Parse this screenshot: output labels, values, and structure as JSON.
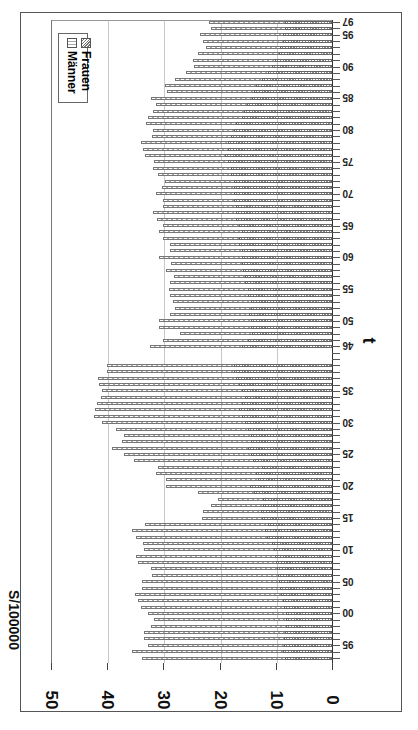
{
  "chart_data": {
    "type": "bar",
    "orientation": "rotated-90-clockwise",
    "title": "",
    "ylabel": "S/100000",
    "xlabel": "t",
    "ylim": [
      0,
      50
    ],
    "yticks": [
      0,
      10,
      20,
      30,
      40,
      50
    ],
    "grid": true,
    "legend_position": "upper-left (rotated)",
    "categories": [
      "1893",
      "1894",
      "1895",
      "1896",
      "1897",
      "1898",
      "1899",
      "1900",
      "1901",
      "1902",
      "1903",
      "1904",
      "1905",
      "1906",
      "1907",
      "1908",
      "1909",
      "1910",
      "1911",
      "1912",
      "1913",
      "1914",
      "1915",
      "1916",
      "1917",
      "1918",
      "1919",
      "1920",
      "1921",
      "1922",
      "1923",
      "1924",
      "1925",
      "1926",
      "1927",
      "1928",
      "1929",
      "1930",
      "1931",
      "1932",
      "1933",
      "1934",
      "1935",
      "1936",
      "1937",
      "1938",
      "1939",
      "",
      "",
      "1946",
      "1947",
      "1948",
      "1949",
      "1950",
      "1951",
      "1952",
      "1953",
      "1954",
      "1955",
      "1956",
      "1957",
      "1958",
      "1959",
      "1960",
      "1961",
      "1962",
      "1963",
      "1964",
      "1965",
      "1966",
      "1967",
      "1968",
      "1969",
      "1970",
      "1971",
      "1972",
      "1973",
      "1974",
      "1975",
      "1976",
      "1977",
      "1978",
      "1979",
      "1980",
      "1981",
      "1982",
      "1983",
      "1984",
      "1985",
      "1986",
      "1987",
      "1988",
      "1989",
      "1990",
      "1991",
      "1992",
      "1993",
      "1994",
      "1995",
      "1996",
      "1997"
    ],
    "category_tick_labels": [
      "95",
      "00",
      "05",
      "10",
      "15",
      "20",
      "25",
      "30",
      "35",
      "46",
      "50",
      "55",
      "60",
      "65",
      "70",
      "75",
      "80",
      "85",
      "90",
      "95",
      "97"
    ],
    "series": [
      {
        "name": "Männer",
        "pattern": "dashed-light",
        "values": [
          33.8,
          35.5,
          32.7,
          33.4,
          33.4,
          32.2,
          31.6,
          32.8,
          34.0,
          34.6,
          35.0,
          33.8,
          33.8,
          32.0,
          32.2,
          34.6,
          34.9,
          33.4,
          33.7,
          34.9,
          35.5,
          33.2,
          23.1,
          22.9,
          21.5,
          20.2,
          23.9,
          29.6,
          29.5,
          31.3,
          31.0,
          35.2,
          37.0,
          39.2,
          37.4,
          37.0,
          38.5,
          40.9,
          42.3,
          42.1,
          41.9,
          41.1,
          40.9,
          41.4,
          41.7,
          40.0,
          40.0,
          null,
          null,
          32.4,
          30.1,
          27.1,
          30.7,
          30.7,
          28.9,
          27.9,
          28.3,
          28.9,
          29.0,
          28.9,
          28.1,
          29.6,
          28.6,
          30.8,
          28.9,
          28.9,
          30.1,
          30.7,
          30.0,
          31.2,
          31.9,
          30.0,
          30.0,
          31.3,
          30.3,
          29.7,
          30.9,
          31.9,
          31.7,
          33.3,
          33.6,
          34.0,
          32.1,
          31.9,
          33.1,
          32.8,
          31.9,
          31.4,
          32.2,
          29.3,
          29.7,
          27.9,
          26.0,
          24.5,
          24.8,
          23.8,
          22.5,
          22.9,
          23.4,
          21.6,
          21.9
        ]
      },
      {
        "name": "Frauen",
        "pattern": "hatched-dark",
        "values": [
          8.4,
          8.7,
          8.5,
          8.5,
          8.3,
          8.2,
          8.1,
          8.2,
          8.5,
          8.7,
          9.0,
          9.2,
          9.5,
          9.6,
          9.8,
          10.0,
          10.2,
          10.4,
          10.6,
          11.5,
          11.9,
          11.4,
          12.5,
          12.6,
          12.2,
          12.2,
          13.8,
          14.6,
          13.2,
          13.5,
          12.5,
          14.0,
          14.5,
          15.0,
          14.5,
          14.5,
          15.0,
          15.5,
          16.0,
          16.5,
          16.0,
          15.5,
          16.0,
          16.5,
          17.0,
          17.5,
          17.5,
          null,
          null,
          16.1,
          15.0,
          14.3,
          14.5,
          14.5,
          14.8,
          14.5,
          14.5,
          15.0,
          15.0,
          15.5,
          15.5,
          15.8,
          16.0,
          16.0,
          16.0,
          16.5,
          16.5,
          16.0,
          16.5,
          17.0,
          17.0,
          17.0,
          17.5,
          17.5,
          17.5,
          17.5,
          18.0,
          18.0,
          18.5,
          19.0,
          18.5,
          18.5,
          18.0,
          17.5,
          17.0,
          16.0,
          15.7,
          15.1,
          14.3,
          13.9,
          13.5,
          12.4,
          11.4,
          10.7,
          10.1,
          9.5,
          9.2,
          8.8,
          8.8,
          8.4,
          8.3
        ]
      }
    ]
  },
  "legend": {
    "items": [
      {
        "label": "Männer"
      },
      {
        "label": "Frauen"
      }
    ]
  },
  "axis": {
    "value_title": "S/100000",
    "category_title": "t",
    "value_tick_labels": [
      "0",
      "10",
      "20",
      "30",
      "40",
      "50"
    ]
  }
}
